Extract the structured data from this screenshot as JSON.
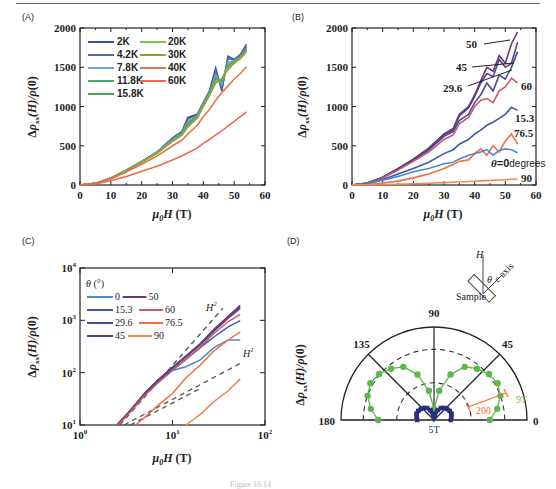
{
  "figure": {
    "caption": "Figure 16.14",
    "panels": {
      "A": {
        "label": "(A)"
      },
      "B": {
        "label": "(B)"
      },
      "C": {
        "label": "(C)"
      },
      "D": {
        "label": "(D)"
      }
    }
  },
  "chart_data": [
    {
      "id": "A",
      "type": "line",
      "title": "",
      "xlabel": "μ0H (T)",
      "ylabel": "Δρxx(H)/ρ(0)",
      "xlim": [
        0,
        60
      ],
      "ylim": [
        0,
        2000
      ],
      "xticks": [
        0,
        10,
        20,
        30,
        40,
        50,
        60
      ],
      "yticks": [
        0,
        500,
        1000,
        1500,
        2000
      ],
      "legend_position": "upper left",
      "grid": false,
      "x": [
        0,
        5,
        10,
        15,
        20,
        25,
        30,
        33,
        35,
        38,
        40,
        42,
        44,
        46,
        48,
        50,
        52,
        54
      ],
      "series": [
        {
          "name": "2K",
          "color": "#3a4f9a",
          "values": [
            0,
            20,
            90,
            190,
            300,
            420,
            600,
            680,
            860,
            900,
            1050,
            1200,
            1490,
            1200,
            1640,
            1600,
            1660,
            1790
          ]
        },
        {
          "name": "4.2K",
          "color": "#5a63a8",
          "values": [
            0,
            20,
            88,
            188,
            298,
            418,
            590,
            670,
            840,
            890,
            1040,
            1190,
            1450,
            1230,
            1610,
            1590,
            1650,
            1760
          ]
        },
        {
          "name": "7.8K",
          "color": "#5fa8d6",
          "values": [
            0,
            20,
            86,
            186,
            296,
            415,
            580,
            660,
            810,
            880,
            1030,
            1180,
            1400,
            1280,
            1560,
            1580,
            1640,
            1740
          ]
        },
        {
          "name": "11.8K",
          "color": "#3fae6a",
          "values": [
            0,
            20,
            85,
            185,
            295,
            412,
            570,
            650,
            790,
            870,
            1020,
            1170,
            1370,
            1320,
            1530,
            1570,
            1630,
            1730
          ]
        },
        {
          "name": "15.8K",
          "color": "#4aa84a",
          "values": [
            0,
            20,
            84,
            184,
            294,
            410,
            565,
            645,
            770,
            865,
            1015,
            1160,
            1340,
            1340,
            1510,
            1560,
            1625,
            1720
          ]
        },
        {
          "name": "20K",
          "color": "#7cc443",
          "values": [
            0,
            20,
            83,
            182,
            292,
            408,
            560,
            640,
            750,
            860,
            1010,
            1150,
            1320,
            1350,
            1490,
            1560,
            1620,
            1710
          ]
        },
        {
          "name": "30K",
          "color": "#9a9a3a",
          "values": [
            0,
            20,
            82,
            180,
            290,
            405,
            555,
            635,
            740,
            850,
            1000,
            1140,
            1300,
            1350,
            1470,
            1550,
            1610,
            1700
          ]
        },
        {
          "name": "40K",
          "color": "#e0784a",
          "values": [
            0,
            18,
            75,
            165,
            265,
            370,
            500,
            570,
            650,
            760,
            870,
            960,
            1080,
            1180,
            1260,
            1350,
            1420,
            1510
          ]
        },
        {
          "name": "60K",
          "color": "#f06a50",
          "values": [
            0,
            14,
            55,
            110,
            175,
            240,
            320,
            370,
            410,
            470,
            530,
            580,
            640,
            690,
            750,
            810,
            870,
            930
          ]
        }
      ]
    },
    {
      "id": "B",
      "type": "line",
      "title": "",
      "xlabel": "μ0H (T)",
      "ylabel": "Δρxx(H)/ρ(0)",
      "xlim": [
        0,
        60
      ],
      "ylim": [
        0,
        2000
      ],
      "xticks": [
        0,
        10,
        20,
        30,
        40,
        50,
        60
      ],
      "yticks": [
        0,
        500,
        1000,
        1500,
        2000
      ],
      "grid": false,
      "x": [
        0,
        5,
        10,
        15,
        20,
        25,
        30,
        33,
        35,
        38,
        40,
        42,
        44,
        46,
        48,
        50,
        52,
        54
      ],
      "series": [
        {
          "name": "50",
          "color": "#6a3a7a",
          "label": "50",
          "values": [
            0,
            25,
            100,
            210,
            330,
            470,
            650,
            720,
            900,
            1000,
            1150,
            1330,
            1500,
            1450,
            1650,
            1550,
            1800,
            1950
          ]
        },
        {
          "name": "45",
          "color": "#5a3f8a",
          "label": "45",
          "values": [
            0,
            24,
            98,
            205,
            325,
            460,
            640,
            700,
            880,
            980,
            1130,
            1300,
            1420,
            1380,
            1600,
            1500,
            1550,
            1820
          ]
        },
        {
          "name": "29.6",
          "color": "#4a4a8f",
          "label": "29.6",
          "values": [
            0,
            23,
            95,
            200,
            315,
            445,
            620,
            680,
            820,
            900,
            1050,
            1150,
            1300,
            1200,
            1400,
            1350,
            1500,
            1700
          ]
        },
        {
          "name": "60",
          "color": "#d05a6a",
          "label": "60",
          "values": [
            0,
            22,
            90,
            190,
            300,
            420,
            580,
            640,
            780,
            860,
            1000,
            1080,
            1100,
            1050,
            1200,
            1250,
            1360,
            1300
          ]
        },
        {
          "name": "15.3",
          "color": "#3e5aa8",
          "label": "15.3",
          "values": [
            0,
            18,
            70,
            140,
            210,
            290,
            400,
            450,
            520,
            580,
            650,
            700,
            760,
            800,
            850,
            900,
            990,
            950
          ]
        },
        {
          "name": "76.5",
          "color": "#f07040",
          "label": "76.5",
          "values": [
            0,
            6,
            25,
            50,
            90,
            140,
            210,
            260,
            300,
            320,
            400,
            460,
            380,
            500,
            420,
            560,
            650,
            520
          ]
        },
        {
          "name": "0",
          "color": "#4a8ad0",
          "label": "θ=0degrees",
          "values": [
            0,
            15,
            60,
            110,
            170,
            210,
            270,
            290,
            330,
            380,
            400,
            420,
            450,
            380,
            440,
            460,
            450,
            410
          ]
        },
        {
          "name": "90",
          "color": "#f08a4a",
          "label": "90",
          "values": [
            0,
            2,
            6,
            10,
            16,
            22,
            30,
            34,
            38,
            44,
            48,
            52,
            56,
            60,
            64,
            68,
            72,
            76
          ]
        }
      ],
      "annotations": [
        "50",
        "45",
        "29.6",
        "60",
        "15.3",
        "76.5",
        "θ=0degrees",
        "90"
      ]
    },
    {
      "id": "C",
      "type": "line",
      "title": "",
      "xlabel": "μ0H (T)",
      "ylabel": "Δρxx(H)/ρ(0)",
      "xscale": "log",
      "yscale": "log",
      "xlim": [
        1,
        100
      ],
      "ylim": [
        10,
        10000
      ],
      "xticks": [
        "10^0",
        "10^1",
        "10^2"
      ],
      "yticks": [
        "10^1",
        "10^2",
        "10^3",
        "10^4"
      ],
      "legend_title": "θ (°)",
      "legend_position": "upper left",
      "grid": false,
      "x": [
        2.5,
        3,
        4,
        5,
        7,
        10,
        14,
        20,
        28,
        40,
        54
      ],
      "series": [
        {
          "name": "0",
          "color": "#4a8ad0",
          "values": [
            10,
            14,
            24,
            38,
            65,
            110,
            130,
            175,
            300,
            420,
            420
          ]
        },
        {
          "name": "15.3",
          "color": "#3e5aa8",
          "values": [
            10,
            14,
            24,
            38,
            68,
            115,
            180,
            300,
            480,
            750,
            990
          ]
        },
        {
          "name": "29.6",
          "color": "#4a4a8f",
          "values": [
            10,
            14,
            25,
            40,
            72,
            125,
            200,
            340,
            620,
            1100,
            1700
          ]
        },
        {
          "name": "45",
          "color": "#5a3f8a",
          "values": [
            10,
            14,
            25,
            40,
            72,
            125,
            205,
            350,
            650,
            1150,
            1820
          ]
        },
        {
          "name": "50",
          "color": "#6a3a7a",
          "values": [
            10,
            14,
            25,
            41,
            73,
            127,
            210,
            360,
            670,
            1200,
            1950
          ]
        },
        {
          "name": "60",
          "color": "#d05a6a",
          "values": [
            10,
            13,
            23,
            37,
            65,
            110,
            180,
            310,
            560,
            950,
            1300
          ]
        },
        {
          "name": "76.5",
          "color": "#f07040",
          "values": [
            null,
            null,
            10,
            14,
            24,
            40,
            80,
            140,
            260,
            420,
            600
          ]
        },
        {
          "name": "90",
          "color": "#f08a4a",
          "values": [
            null,
            null,
            null,
            null,
            null,
            null,
            10,
            16,
            28,
            45,
            76
          ]
        }
      ],
      "reference_lines": [
        {
          "name": "H^2",
          "style": "dashed",
          "color": "#555555",
          "x": [
            2.7,
            35
          ],
          "y": [
            10,
            1700
          ]
        },
        {
          "name": "H^1",
          "style": "dashed",
          "color": "#555555",
          "x": [
            3,
            54
          ],
          "y": [
            10,
            150
          ]
        },
        {
          "name": "lower",
          "style": "dashed",
          "color": "#555555",
          "x": [
            3.5,
            20
          ],
          "y": [
            10,
            50
          ]
        }
      ],
      "annotations": [
        "H^2",
        "H^1"
      ]
    },
    {
      "id": "D",
      "type": "polar",
      "title": "",
      "ylabel": "Δρxx(H)/ρ(0)",
      "angle_range": [
        0,
        180
      ],
      "angle_ticks": [
        0,
        45,
        90,
        135,
        180
      ],
      "scale_bar": {
        "label": "200",
        "color": "#f07040"
      },
      "series": [
        {
          "name": "9T",
          "color": "#5db84a",
          "marker": "circle",
          "theta": [
            0,
            10,
            20,
            30,
            40,
            50,
            60,
            70,
            80,
            90,
            100,
            110,
            120,
            130,
            140,
            150,
            160,
            170,
            180
          ],
          "r": [
            300,
            345,
            380,
            395,
            385,
            360,
            330,
            260,
            160,
            60,
            160,
            260,
            330,
            360,
            385,
            395,
            380,
            345,
            300
          ]
        },
        {
          "name": "5T",
          "color": "#2a2f7a",
          "marker": "square",
          "theta": [
            0,
            10,
            20,
            30,
            40,
            50,
            60,
            70,
            80,
            90,
            100,
            110,
            120,
            130,
            140,
            150,
            160,
            170,
            180
          ],
          "r": [
            90,
            95,
            100,
            98,
            92,
            85,
            75,
            55,
            30,
            15,
            30,
            55,
            75,
            85,
            92,
            98,
            100,
            95,
            90
          ]
        }
      ],
      "inset": {
        "labels": [
          "H",
          "θ",
          "c axis",
          "Sample"
        ]
      },
      "annotations": [
        "90",
        "135",
        "45",
        "180",
        "0",
        "9T",
        "5T",
        "200"
      ]
    }
  ]
}
